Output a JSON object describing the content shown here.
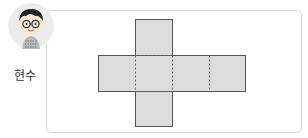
{
  "character": {
    "name": "현수",
    "icon": "boy-with-glasses-icon"
  },
  "diagram": {
    "type": "cube-net",
    "fill": "#dcdcdc",
    "stroke": "#555555",
    "faces": 6
  }
}
